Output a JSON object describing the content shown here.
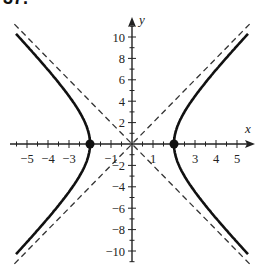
{
  "problem_number": "37.",
  "chart_data": {
    "type": "line",
    "title": "",
    "xlabel": "x",
    "ylabel": "y",
    "xlim": [
      -6,
      6
    ],
    "ylim": [
      -11,
      11
    ],
    "grid": false,
    "x_tick_labels": [
      "-5",
      "-4",
      "-3",
      "-1",
      "1",
      "3",
      "4",
      "5"
    ],
    "x_tick_values": [
      -5,
      -4,
      -3,
      -1,
      1,
      3,
      4,
      5
    ],
    "x_minor_ticks": [
      -5.5,
      -5,
      -4.5,
      -4,
      -3.5,
      -3,
      -2.5,
      -2,
      -1.5,
      -1,
      -0.5,
      0.5,
      1,
      1.5,
      2,
      2.5,
      3,
      3.5,
      4,
      4.5,
      5,
      5.5
    ],
    "y_tick_labels": [
      "10",
      "8",
      "6",
      "4",
      "2",
      "-2",
      "-4",
      "-6",
      "-8",
      "-10"
    ],
    "y_tick_values": [
      10,
      8,
      6,
      4,
      2,
      -2,
      -4,
      -6,
      -8,
      -10
    ],
    "y_minor_ticks": [
      11,
      10,
      9,
      8,
      7,
      6,
      5,
      4,
      3,
      2,
      1,
      -1,
      -2,
      -3,
      -4,
      -5,
      -6,
      -7,
      -8,
      -9,
      -10,
      -11
    ],
    "series": [
      {
        "name": "hyperbola right branch",
        "style": "solid",
        "equation": "x^2/4 - y^2/16 = 1, x > 0",
        "points": [
          [
            5.5,
            10.25
          ],
          [
            4,
            6.93
          ],
          [
            3,
            4.47
          ],
          [
            2.5,
            3
          ],
          [
            2,
            0
          ],
          [
            2.5,
            -3
          ],
          [
            3,
            -4.47
          ],
          [
            4,
            -6.93
          ],
          [
            5.5,
            -10.25
          ]
        ]
      },
      {
        "name": "hyperbola left branch",
        "style": "solid",
        "equation": "x^2/4 - y^2/16 = 1, x < 0",
        "points": [
          [
            -5.5,
            10.25
          ],
          [
            -4,
            6.93
          ],
          [
            -3,
            4.47
          ],
          [
            -2.5,
            3
          ],
          [
            -2,
            0
          ],
          [
            -2.5,
            -3
          ],
          [
            -3,
            -4.47
          ],
          [
            -4,
            -6.93
          ],
          [
            -5.5,
            -10.25
          ]
        ]
      },
      {
        "name": "asymptote y = 2x",
        "style": "dashed",
        "points": [
          [
            -5.6,
            -11.2
          ],
          [
            5.6,
            11.2
          ]
        ]
      },
      {
        "name": "asymptote y = -2x",
        "style": "dashed",
        "points": [
          [
            -5.6,
            11.2
          ],
          [
            5.6,
            -11.2
          ]
        ]
      }
    ],
    "highlighted_points": [
      {
        "label": "left vertex",
        "x": -2,
        "y": 0
      },
      {
        "label": "right vertex",
        "x": 2,
        "y": 0
      }
    ],
    "colors": {
      "curve": "#111111",
      "asymptote": "#333333",
      "axis": "#222222"
    }
  }
}
